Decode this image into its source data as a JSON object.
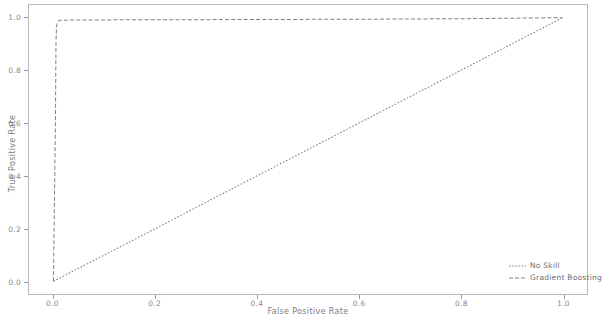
{
  "chart_data": {
    "type": "line",
    "title": "",
    "xlabel": "False Positive Rate",
    "ylabel": "True Positive Rate",
    "xlim": [
      -0.048,
      1.048
    ],
    "ylim": [
      -0.048,
      1.048
    ],
    "xticks": [
      "0.0",
      "0.2",
      "0.4",
      "0.6",
      "0.8",
      "1.0"
    ],
    "xtick_values": [
      0.0,
      0.2,
      0.4,
      0.6,
      0.8,
      1.0
    ],
    "yticks": [
      "0.0",
      "0.2",
      "0.4",
      "0.6",
      "0.8",
      "1.0"
    ],
    "ytick_values": [
      0.0,
      0.2,
      0.4,
      0.6,
      0.8,
      1.0
    ],
    "grid": false,
    "legend_position": "lower right",
    "series": [
      {
        "name": "No Skill",
        "linestyle": "dotted",
        "color": "#808080",
        "x": [
          0.0,
          1.0
        ],
        "y": [
          0.0,
          1.0
        ]
      },
      {
        "name": "Gradient Boosting",
        "linestyle": "dashed",
        "color": "#808080",
        "x": [
          0.0,
          0.004,
          0.005,
          0.006,
          0.008,
          0.012,
          0.02,
          0.05,
          0.1,
          0.2,
          0.3,
          0.4,
          0.5,
          0.6,
          0.7,
          0.8,
          0.9,
          1.0
        ],
        "y": [
          0.0,
          0.62,
          0.9,
          0.965,
          0.985,
          0.99,
          0.9905,
          0.991,
          0.9915,
          0.992,
          0.9925,
          0.993,
          0.9935,
          0.994,
          0.995,
          0.996,
          0.998,
          1.0
        ]
      }
    ]
  },
  "legend": {
    "items": [
      {
        "label": "No Skill",
        "style": "dotted"
      },
      {
        "label": "Gradient Boosting",
        "style": "dashed"
      }
    ]
  },
  "colors": {
    "background": "#ffffff",
    "frame": "#b9b9b9",
    "line": "#808080",
    "text": "#7d7d7d"
  }
}
